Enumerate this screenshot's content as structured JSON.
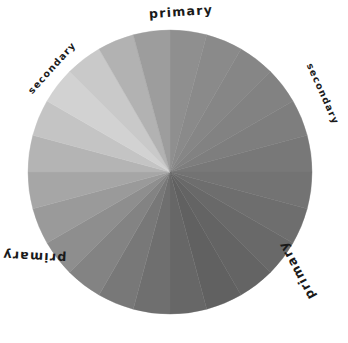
{
  "figure": {
    "kind": "color-wheel",
    "background_color": "#ffffff",
    "rendering": "grayscale"
  },
  "wheel": {
    "center_x": 170,
    "center_y": 172,
    "radius": 142,
    "segment_count": 24,
    "segment_angle_deg": 15,
    "start_angle_deg": 0,
    "segment_colors": [
      "#8f8f8f",
      "#8a8a8a",
      "#868686",
      "#828282",
      "#7e7e7e",
      "#787878",
      "#737373",
      "#6e6e6e",
      "#696969",
      "#646464",
      "#616161",
      "#676767",
      "#6f6f6f",
      "#787878",
      "#838383",
      "#8e8e8e",
      "#9a9a9a",
      "#a6a6a6",
      "#b4b4b4",
      "#c4c4c4",
      "#d2d2d2",
      "#c9c9c9",
      "#b2b2b2",
      "#9d9d9d"
    ],
    "segment_labels": [
      "segment-1",
      "segment-2",
      "segment-3",
      "segment-4",
      "segment-5",
      "segment-6",
      "segment-7",
      "segment-8",
      "segment-9",
      "segment-10",
      "segment-11",
      "segment-12",
      "segment-13",
      "segment-14",
      "segment-15",
      "segment-16",
      "segment-17",
      "segment-18",
      "segment-19",
      "segment-20",
      "segment-21",
      "segment-22",
      "segment-23",
      "segment-24"
    ]
  },
  "labels": [
    {
      "id": "primary-top",
      "text": "primary",
      "kind": "primary",
      "left": 149,
      "top": 6,
      "rotation_deg": -4,
      "font_size": 12.5
    },
    {
      "id": "secondary-upper-left",
      "text": "secondary",
      "kind": "secondary",
      "left": 19,
      "top": 63,
      "rotation_deg": -48,
      "font_size": 9.5
    },
    {
      "id": "secondary-right",
      "text": "secondary",
      "kind": "secondary",
      "left": 290,
      "top": 89,
      "rotation_deg": 66,
      "font_size": 9.5
    },
    {
      "id": "primary-lower-right",
      "text": "primary",
      "kind": "primary",
      "left": 265,
      "top": 264,
      "rotation_deg": 242,
      "font_size": 12.5
    },
    {
      "id": "primary-left",
      "text": "primary",
      "kind": "primary",
      "left": 2,
      "top": 250,
      "rotation_deg": 183,
      "font_size": 12.5
    }
  ]
}
